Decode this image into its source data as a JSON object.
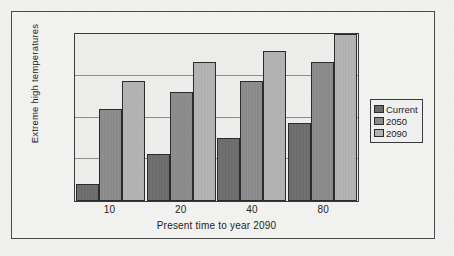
{
  "chart_data": {
    "type": "bar",
    "title": "",
    "subtitle": "",
    "xlabel": "Present time to year 2090",
    "ylabel": "Extreme high temperatures",
    "categories": [
      "10",
      "20",
      "40",
      "80"
    ],
    "series": [
      {
        "name": "Current",
        "color": "#6d6d6d",
        "values": [
          10,
          28,
          38,
          47
        ]
      },
      {
        "name": "2050",
        "color": "#8c8c8c",
        "values": [
          55,
          65,
          72,
          83
        ]
      },
      {
        "name": "2090",
        "color": "#b6b6b6",
        "values": [
          72,
          83,
          90,
          100
        ]
      }
    ],
    "ylim": [
      0,
      100
    ],
    "y_tick_labels": [],
    "gridlines": [
      25,
      50,
      75
    ],
    "grid": true,
    "legend_position": "right",
    "annotations": []
  },
  "legend": {
    "items": [
      {
        "label": "Current",
        "swatch": "legend-swatch-current"
      },
      {
        "label": "2050",
        "swatch": "legend-swatch-2050"
      },
      {
        "label": "2090",
        "swatch": "legend-swatch-2090"
      }
    ]
  },
  "axes": {
    "x_title": "Present time to year 2090",
    "y_title": "Extreme high temperatures",
    "x_ticks": [
      "10",
      "20",
      "40",
      "80"
    ]
  }
}
